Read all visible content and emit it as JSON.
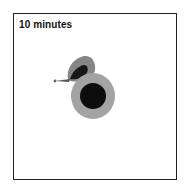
{
  "panel": {
    "label": "10 minutes"
  },
  "figure": {
    "colors": {
      "frame": "#222222",
      "core": "#0d0d0d",
      "halo": "#a8a8a8",
      "lobe_outer": "#8a8a8a",
      "lobe_inner": "#1a1a1a"
    }
  }
}
